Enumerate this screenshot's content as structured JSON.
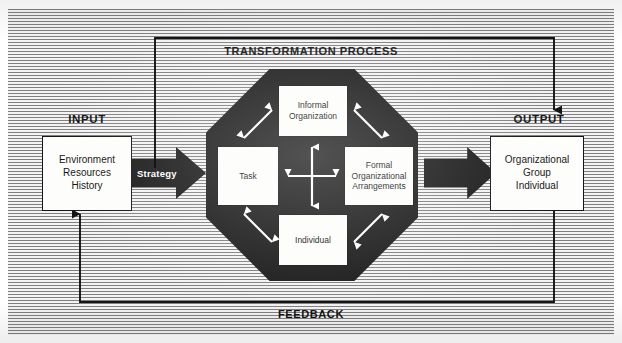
{
  "diagram": {
    "colors": {
      "ink": "#141414",
      "octagon_fill": "#191919",
      "box_fill": "#fdfdfb",
      "hatch_dark": "#7f7f7f",
      "hatch_light": "#f3f3f3",
      "arrow_white": "#ffffff"
    }
  },
  "input": {
    "label": "INPUT",
    "box": {
      "lines": [
        "Environment",
        "Resources",
        "History"
      ],
      "line1": "Environment",
      "line2": "Resources",
      "line3": "History"
    }
  },
  "strategy_arrow": {
    "label": "Strategy",
    "icon": "block-arrow-right-icon"
  },
  "transformation": {
    "label": "TRANSFORMATION PROCESS",
    "components": {
      "informal": {
        "lines": [
          "Informal",
          "Organization"
        ],
        "line1": "Informal",
        "line2": "Organization"
      },
      "task": {
        "lines": [
          "Task"
        ],
        "line1": "Task"
      },
      "formal": {
        "lines": [
          "Formal",
          "Organizational",
          "Arrangements"
        ],
        "line1": "Formal",
        "line2": "Organizational",
        "line3": "Arrangements"
      },
      "individual": {
        "lines": [
          "Individual"
        ],
        "line1": "Individual"
      }
    },
    "congruence_arrows": [
      "task-to-informal",
      "informal-to-formal",
      "task-to-individual",
      "individual-to-formal",
      "task-to-formal",
      "informal-to-individual"
    ]
  },
  "output_arrow": {
    "icon": "block-arrow-right-icon"
  },
  "output": {
    "label": "OUTPUT",
    "box": {
      "lines": [
        "Organizational",
        "Group",
        "Individual"
      ],
      "line1": "Organizational",
      "line2": "Group",
      "line3": "Individual"
    }
  },
  "feedback": {
    "label": "FEEDBACK"
  }
}
